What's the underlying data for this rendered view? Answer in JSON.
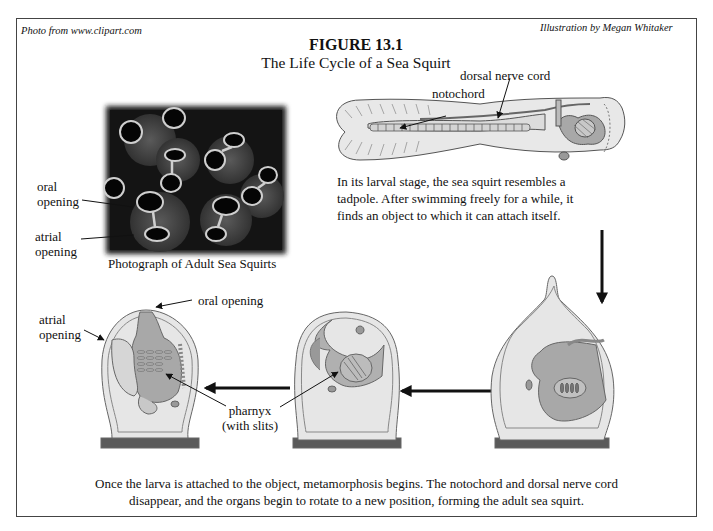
{
  "credits": {
    "photo": "Photo from www.clipart.com",
    "illustration": "Illustration by Megan Whitaker"
  },
  "figure": {
    "number": "FIGURE 13.1",
    "title": "The Life Cycle of a Sea Squirt"
  },
  "photo": {
    "caption": "Photograph of Adult Sea Squirts",
    "labels": {
      "oral_opening": [
        "oral",
        "opening"
      ],
      "atrial_opening": [
        "atrial",
        "opening"
      ]
    }
  },
  "larva": {
    "labels": {
      "notochord": "notochord",
      "dorsal_nerve_cord": "dorsal nerve cord"
    },
    "description": [
      "In its larval stage, the sea squirt resembles a",
      "tadpole.  After swimming freely for a while, it",
      "finds an object to which it can attach itself."
    ]
  },
  "adult": {
    "labels": {
      "oral_opening": "oral opening",
      "atrial_opening": [
        "atrial",
        "opening"
      ],
      "pharnyx": [
        "pharnyx",
        "(with slits)"
      ]
    }
  },
  "bottom_caption": [
    "Once the larva is attached to the object, metamorphosis begins.  The notochord and dorsal nerve cord",
    "disappear, and the organs begin to rotate to a new position, forming the adult sea squirt."
  ],
  "colors": {
    "body_fill": "#e6e6e6",
    "organ_fill": "#a8a8a8",
    "base_fill": "#5a5a5a",
    "outline": "#555555",
    "photo_bg": "#141414"
  }
}
